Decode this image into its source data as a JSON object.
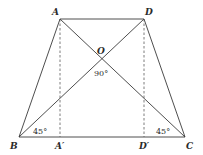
{
  "diagram": {
    "points": {
      "A": {
        "label": "A",
        "x": 60,
        "y": 19
      },
      "D": {
        "label": "D",
        "x": 144,
        "y": 19
      },
      "B": {
        "label": "B",
        "x": 19,
        "y": 137
      },
      "C": {
        "label": "C",
        "x": 185,
        "y": 137
      },
      "O": {
        "label": "O",
        "x": 102,
        "y": 59
      },
      "A_prime": {
        "label": "A′",
        "x": 60,
        "y": 137
      },
      "D_prime": {
        "label": "D′",
        "x": 144,
        "y": 137
      }
    },
    "angles": {
      "at_O": "90°",
      "at_B": "45°",
      "at_C": "45°"
    },
    "segments": [
      {
        "from": "A",
        "to": "D",
        "style": "solid"
      },
      {
        "from": "A",
        "to": "B",
        "style": "solid"
      },
      {
        "from": "D",
        "to": "C",
        "style": "solid"
      },
      {
        "from": "B",
        "to": "C",
        "style": "solid"
      },
      {
        "from": "A",
        "to": "C",
        "style": "solid"
      },
      {
        "from": "B",
        "to": "D",
        "style": "solid"
      },
      {
        "from": "A",
        "to": "A_prime",
        "style": "dashed"
      },
      {
        "from": "D",
        "to": "D_prime",
        "style": "dashed"
      }
    ]
  }
}
